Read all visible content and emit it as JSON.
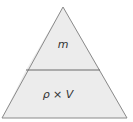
{
  "diagram": {
    "type": "formula-triangle",
    "top_section": {
      "label": "m"
    },
    "bottom_section": {
      "label": "ρ × V"
    },
    "colors": {
      "fill": "#ececec",
      "outline": "#8a8a8a",
      "divider": "#6a6a6a",
      "text": "#333333"
    }
  }
}
